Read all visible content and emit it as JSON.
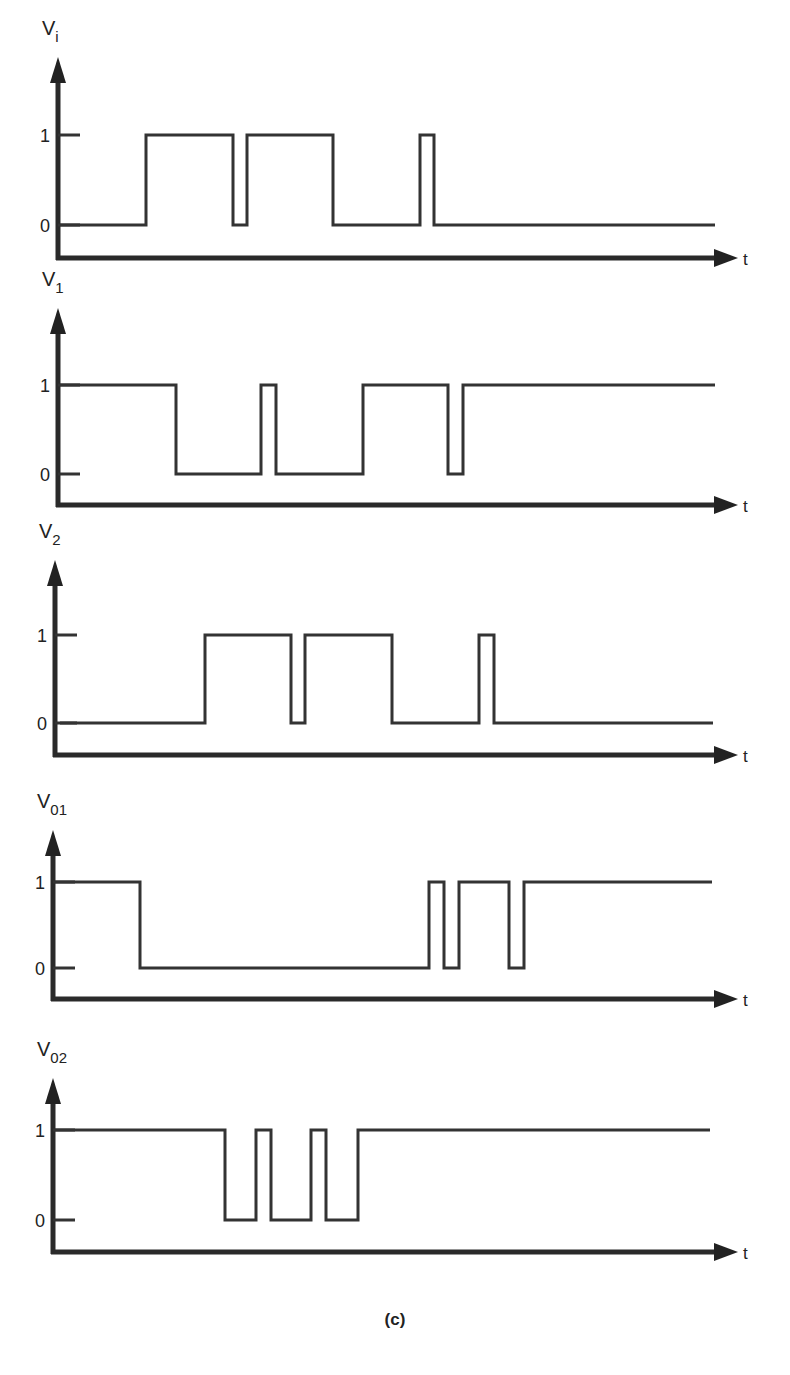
{
  "figure": {
    "caption": "(c)",
    "x_axis_label": "t",
    "level_high_label": "1",
    "level_low_label": "0"
  },
  "colors": {
    "stroke": "#333333",
    "axis": "#2a2a2a",
    "background": "#ffffff"
  },
  "chart_data": {
    "type": "line",
    "xlabel": "t",
    "ylabel": "logic level",
    "ylim": [
      0,
      1
    ],
    "grid": false,
    "note": "x values are approximate horizontal pixel positions of transitions; waveforms are step functions",
    "series": [
      {
        "name": "Vi",
        "label_main": "V",
        "label_sub": "i",
        "initial": 0,
        "x_start": 60,
        "x_end": 715,
        "transitions": [
          146,
          233,
          247,
          333,
          420,
          434
        ]
      },
      {
        "name": "V1",
        "label_main": "V",
        "label_sub": "1",
        "initial": 1,
        "x_start": 60,
        "x_end": 715,
        "transitions": [
          176,
          261,
          276,
          363,
          448,
          463
        ]
      },
      {
        "name": "V2",
        "label_main": "V",
        "label_sub": "2",
        "initial": 0,
        "x_start": 60,
        "x_end": 713,
        "transitions": [
          205,
          291,
          305,
          392,
          479,
          494
        ]
      },
      {
        "name": "V01",
        "label_main": "V",
        "label_sub": "01",
        "initial": 1,
        "x_start": 55,
        "x_end": 712,
        "transitions": [
          140,
          429,
          444,
          459,
          509,
          524
        ]
      },
      {
        "name": "V02",
        "label_main": "V",
        "label_sub": "02",
        "initial": 1,
        "x_start": 55,
        "x_end": 710,
        "transitions": [
          225,
          256,
          271,
          311,
          326,
          358
        ]
      }
    ]
  },
  "panels": [
    {
      "label_main": "V",
      "label_sub": "i",
      "top": 20,
      "y_high": 135,
      "y_low": 225,
      "axis_y": 258,
      "axis_x": 58,
      "arrow_top": 57
    },
    {
      "label_main": "V",
      "label_sub": "1",
      "top": 280,
      "y_high": 385,
      "y_low": 474,
      "axis_y": 505,
      "axis_x": 58,
      "arrow_top": 308
    },
    {
      "label_main": "V",
      "label_sub": "2",
      "top": 540,
      "y_high": 635,
      "y_low": 723,
      "axis_y": 755,
      "axis_x": 55,
      "arrow_top": 560
    },
    {
      "label_main": "V",
      "label_sub": "01",
      "top": 800,
      "y_high": 882,
      "y_low": 968,
      "axis_y": 999,
      "axis_x": 53,
      "arrow_top": 830
    },
    {
      "label_main": "V",
      "label_sub": "02",
      "top": 1050,
      "y_high": 1130,
      "y_low": 1220,
      "axis_y": 1252,
      "axis_x": 53,
      "arrow_top": 1078
    }
  ]
}
